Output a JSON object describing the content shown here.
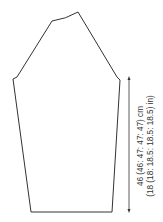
{
  "diagram": {
    "type": "knitting-schematic",
    "stroke_color": "#333333",
    "background_color": "#ffffff",
    "measurement": {
      "label_cm": "46 (46: 47: 47: 47) cm",
      "label_in": "(18 (18: 18.5: 18.5: 18.5) in)",
      "orientation": "vertical",
      "spans": "underarm-to-cuff"
    }
  }
}
